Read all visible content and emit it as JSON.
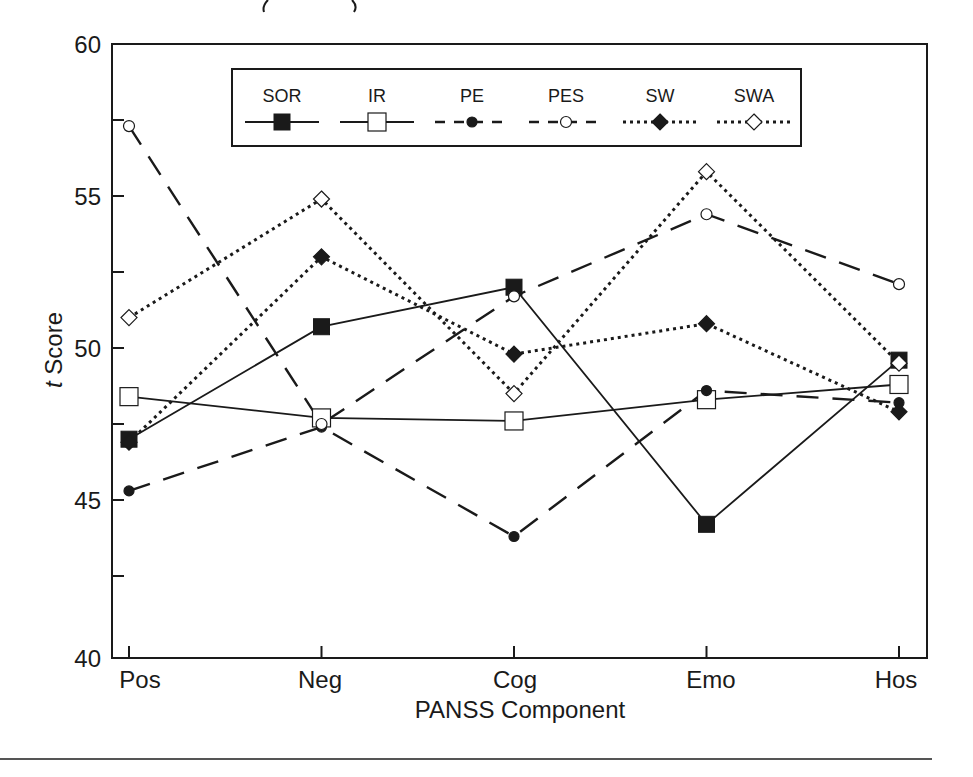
{
  "chart_data": {
    "type": "line",
    "title": "",
    "xlabel": "PANSS Component",
    "ylabel_italic": "t",
    "ylabel_rest": " Score",
    "ylabel": "t Score",
    "categories": [
      "Pos",
      "Neg",
      "Cog",
      "Emo",
      "Hos"
    ],
    "ylim": [
      40,
      60
    ],
    "yticks_labeled": [
      40,
      45,
      50,
      55,
      60
    ],
    "yticks_minor": [
      42.5,
      47.5,
      52.5,
      57.5
    ],
    "grid": false,
    "legend_position": "top-inside",
    "series": [
      {
        "name": "SOR",
        "values": [
          47.0,
          50.7,
          52.0,
          44.2,
          49.6
        ],
        "line": "solid",
        "marker": "square-filled"
      },
      {
        "name": "IR",
        "values": [
          48.4,
          47.7,
          47.6,
          48.3,
          48.8
        ],
        "line": "solid",
        "marker": "square-open"
      },
      {
        "name": "PE",
        "values": [
          45.3,
          47.4,
          43.8,
          48.6,
          48.2
        ],
        "line": "dashed",
        "marker": "circle-filled"
      },
      {
        "name": "PES",
        "values": [
          57.3,
          47.5,
          51.7,
          54.4,
          52.1
        ],
        "line": "dashed",
        "marker": "circle-open"
      },
      {
        "name": "SW",
        "values": [
          46.9,
          53.0,
          49.8,
          50.8,
          47.9
        ],
        "line": "dotted",
        "marker": "diamond-filled"
      },
      {
        "name": "SWA",
        "values": [
          51.0,
          54.9,
          48.5,
          55.8,
          49.5
        ],
        "line": "dotted",
        "marker": "diamond-open"
      }
    ]
  },
  "axes": {
    "y_tick_labels": [
      "60",
      "55",
      "50",
      "45",
      "40"
    ],
    "x_tick_labels": [
      "Pos",
      "Neg",
      "Cog",
      "Emo",
      "Hos"
    ],
    "x_title": "PANSS Component"
  },
  "legend": {
    "items": [
      {
        "label": "SOR"
      },
      {
        "label": "IR"
      },
      {
        "label": "PE"
      },
      {
        "label": "PES"
      },
      {
        "label": "SW"
      },
      {
        "label": "SWA"
      }
    ]
  },
  "colors": {
    "ink": "#1a1a1a",
    "background": "#ffffff"
  }
}
